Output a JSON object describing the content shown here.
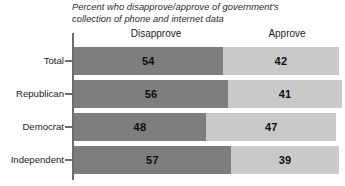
{
  "chart_data": {
    "type": "bar",
    "orientation": "horizontal",
    "stacked": true,
    "title": "Percent who disapprove/approve of government's collection of phone and internet data",
    "title_line1": "Percent who disapprove/approve of government's",
    "title_line2": "collection of phone and internet data",
    "xlabel": "",
    "ylabel": "",
    "categories": [
      "Total",
      "Republican",
      "Democrat",
      "Independent"
    ],
    "series": [
      {
        "name": "Disapprove",
        "values": [
          54,
          56,
          48,
          57
        ],
        "color": "#7e7e7e"
      },
      {
        "name": "Approve",
        "values": [
          42,
          41,
          47,
          39
        ],
        "color": "#c9c9c9"
      }
    ],
    "legend": [
      "Disapprove",
      "Approve"
    ],
    "legend_position": "top",
    "grid": false,
    "xlim": [
      0,
      100
    ]
  },
  "headers": {
    "disapprove": "Disapprove",
    "approve": "Approve"
  },
  "rows": [
    {
      "label": "Total",
      "disapprove": 54,
      "approve": 42
    },
    {
      "label": "Republican",
      "disapprove": 56,
      "approve": 41
    },
    {
      "label": "Democrat",
      "disapprove": 48,
      "approve": 47
    },
    {
      "label": "Independent",
      "disapprove": 57,
      "approve": 39
    }
  ],
  "colors": {
    "disapprove": "#7e7e7e",
    "approve": "#c9c9c9",
    "axis": "#6e6e6e",
    "background": "#ffffff",
    "text": "#1c1c1c"
  }
}
